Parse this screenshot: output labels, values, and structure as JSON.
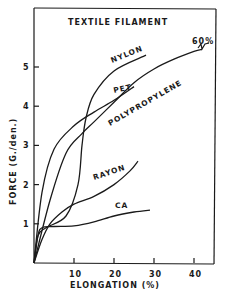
{
  "chart_data": {
    "type": "line",
    "title": "TEXTILE FILAMENT",
    "xlabel": "ELONGATION (%)",
    "ylabel": "FORCE (G./den.)",
    "xlim": [
      0,
      45
    ],
    "ylim": [
      0,
      5.9
    ],
    "x_ticks": [
      10,
      20,
      30,
      40
    ],
    "x_tick_labels": [
      "10",
      "20",
      "30",
      "40"
    ],
    "y_ticks": [
      1,
      2,
      3,
      4,
      5
    ],
    "y_tick_labels": [
      "1",
      "2",
      "3",
      "4",
      "5"
    ],
    "grid": false,
    "legend": "inline curve labels",
    "annotations": [
      "60%"
    ],
    "series": [
      {
        "name": "NYLON",
        "x": [
          0,
          1,
          3,
          8,
          11,
          12,
          13,
          15,
          20,
          28
        ],
        "y": [
          0,
          0.7,
          0.9,
          1.2,
          2.0,
          3.0,
          3.7,
          4.3,
          4.9,
          5.3
        ]
      },
      {
        "name": "PET",
        "x": [
          0,
          2,
          5,
          10,
          15,
          20,
          25
        ],
        "y": [
          0,
          1.8,
          2.9,
          3.5,
          3.85,
          4.15,
          4.5
        ]
      },
      {
        "name": "POLYPROPYLENE",
        "x": [
          0,
          4,
          8,
          12,
          15,
          20,
          25,
          30,
          35,
          40,
          42
        ],
        "y": [
          0,
          1.6,
          2.8,
          3.3,
          3.6,
          4.1,
          4.6,
          4.95,
          5.2,
          5.4,
          5.45
        ]
      },
      {
        "name": "RAYON",
        "x": [
          0,
          2,
          4,
          7,
          10,
          15,
          20,
          24,
          26
        ],
        "y": [
          0,
          0.6,
          1.0,
          1.3,
          1.5,
          1.7,
          2.0,
          2.35,
          2.6
        ]
      },
      {
        "name": "CA",
        "x": [
          0,
          1,
          2,
          5,
          10,
          15,
          20,
          25,
          29
        ],
        "y": [
          0,
          0.7,
          0.9,
          0.93,
          0.95,
          1.05,
          1.2,
          1.3,
          1.35
        ]
      }
    ]
  },
  "labels": {
    "title": "TEXTILE FILAMENT",
    "xlabel": "ELONGATION (%)",
    "ylabel": "FORCE (G./den.)",
    "nylon": "NYLON",
    "pet": "PET",
    "polypropylene": "POLYPROPYLENE",
    "rayon": "RAYON",
    "ca": "CA",
    "break": "60%"
  }
}
